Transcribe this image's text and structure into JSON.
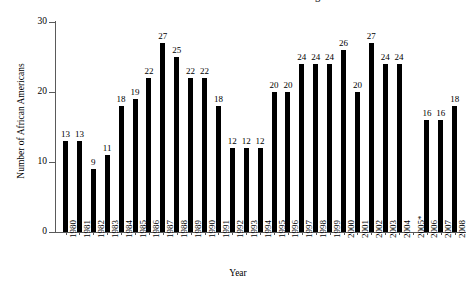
{
  "chart_data": {
    "type": "bar",
    "title": "African American Architecture UVCU Undergraduates",
    "xlabel": "Year",
    "ylabel": "Number of African Americans",
    "categories": [
      "1980",
      "1981",
      "1982",
      "1983",
      "1984",
      "1985",
      "1986",
      "1987",
      "1988",
      "1989",
      "1990",
      "1991",
      "1992",
      "1993",
      "1994",
      "1995",
      "1996",
      "1997",
      "1998",
      "1999",
      "2000",
      "2001",
      "2002",
      "2003",
      "2004",
      "2005*",
      "2006",
      "2007",
      "2008"
    ],
    "values": [
      13,
      13,
      9,
      11,
      18,
      19,
      22,
      27,
      25,
      22,
      22,
      18,
      12,
      12,
      12,
      20,
      20,
      24,
      24,
      24,
      26,
      20,
      27,
      24,
      24,
      null,
      16,
      16,
      18
    ],
    "value_labels": [
      "13",
      "13",
      "9",
      "11",
      "18",
      "19",
      "22",
      "27",
      "25",
      "22",
      "22",
      "18",
      "12",
      "12",
      "12",
      "20",
      "20",
      "24",
      "24",
      "24",
      "26",
      "20",
      "27",
      "24",
      "24",
      "",
      "16",
      "16",
      "18"
    ],
    "ylim": [
      0,
      30
    ],
    "yticks": [
      0,
      10,
      20,
      30
    ],
    "ytick_labels": [
      "0",
      "10",
      "20",
      "30"
    ],
    "grid": false,
    "legend": false,
    "bar_color": "#000000",
    "axis_color": "#5a5a5a",
    "note": "2005* has no bar (missing data)"
  },
  "figure": {
    "title_clipped": true
  }
}
